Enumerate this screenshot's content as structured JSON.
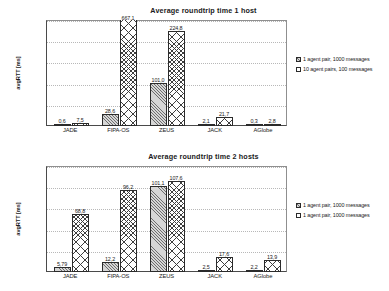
{
  "charts": [
    {
      "title": "Average roundtrip time 1 host",
      "ylabel": "avgRTT [ms]",
      "ylim": [
        0,
        250
      ],
      "yticks": [
        "0,0",
        "50,0",
        "100,0",
        "150,0",
        "200,0",
        "250,0"
      ],
      "ytick_values": [
        0,
        50,
        100,
        150,
        200,
        250
      ],
      "categories": [
        "JADE",
        "FIPA-OS",
        "ZEUS",
        "JACK",
        "AGlobe"
      ],
      "legend": [
        "1 agent pair, 1000 messages",
        "10 agent pairs, 100 messages"
      ],
      "series": [
        {
          "name": "1 agent pair, 1000 messages",
          "values": [
            0.6,
            28.6,
            101.0,
            2.1,
            0.3
          ],
          "labels": [
            "0,6",
            "28,6",
            "101,0",
            "2,1",
            "0,3"
          ]
        },
        {
          "name": "10 agent pairs, 100 messages",
          "values": [
            7.5,
            667.1,
            224.8,
            21.7,
            2.8
          ],
          "labels": [
            "7,5",
            "667,1",
            "224,8",
            "21,7",
            "2,8"
          ]
        }
      ]
    },
    {
      "title": "Average roundtrip time 2 hosts",
      "ylabel": "avgRTT [ms]",
      "ylim": [
        0,
        125
      ],
      "yticks": [
        "0,0",
        "25,0",
        "50,0",
        "75,0",
        "100,0",
        "125,0"
      ],
      "ytick_values": [
        0,
        25,
        50,
        75,
        100,
        125
      ],
      "categories": [
        "JADE",
        "FIPA-OS",
        "ZEUS",
        "JACK",
        "AGlobe"
      ],
      "legend": [
        "1 agent pair, 1000 messages",
        "1 agent pair, 1000 messages"
      ],
      "series": [
        {
          "name": "1 agent pair, 1000 messages",
          "values": [
            5.79,
            12.2,
            101.1,
            2.5,
            2.2
          ],
          "labels": [
            "5,79",
            "12,2",
            "101,1",
            "2,5",
            "2,2"
          ]
        },
        {
          "name": "1 agent pair, 1000 messages",
          "values": [
            68.8,
            96.2,
            107.6,
            17.6,
            13.9
          ],
          "labels": [
            "68,8",
            "96,2",
            "107,6",
            "17,6",
            "13,9"
          ]
        }
      ]
    }
  ],
  "chart_data": [
    {
      "type": "bar",
      "title": "Average roundtrip time 1 host",
      "xlabel": "",
      "ylabel": "avgRTT [ms]",
      "ylim": [
        0,
        250
      ],
      "grid": true,
      "legend_position": "right",
      "categories": [
        "JADE",
        "FIPA-OS",
        "ZEUS",
        "JACK",
        "AGlobe"
      ],
      "series": [
        {
          "name": "1 agent pair, 1000 messages",
          "values": [
            0.6,
            28.6,
            101.0,
            2.1,
            0.3
          ]
        },
        {
          "name": "10 agent pairs, 100 messages",
          "values": [
            7.5,
            667.1,
            224.8,
            21.7,
            2.8
          ]
        }
      ],
      "notes": "The 667,1 bar for FIPA-OS is clipped by the 250,0 axis maximum."
    },
    {
      "type": "bar",
      "title": "Average roundtrip time 2 hosts",
      "xlabel": "",
      "ylabel": "avgRTT [ms]",
      "ylim": [
        0,
        125
      ],
      "grid": true,
      "legend_position": "right",
      "categories": [
        "JADE",
        "FIPA-OS",
        "ZEUS",
        "JACK",
        "AGlobe"
      ],
      "series": [
        {
          "name": "1 agent pair, 1000 messages",
          "values": [
            5.79,
            12.2,
            101.1,
            2.5,
            2.2
          ]
        },
        {
          "name": "1 agent pair, 1000 messages",
          "values": [
            68.8,
            96.2,
            107.6,
            17.6,
            13.9
          ]
        }
      ]
    }
  ]
}
